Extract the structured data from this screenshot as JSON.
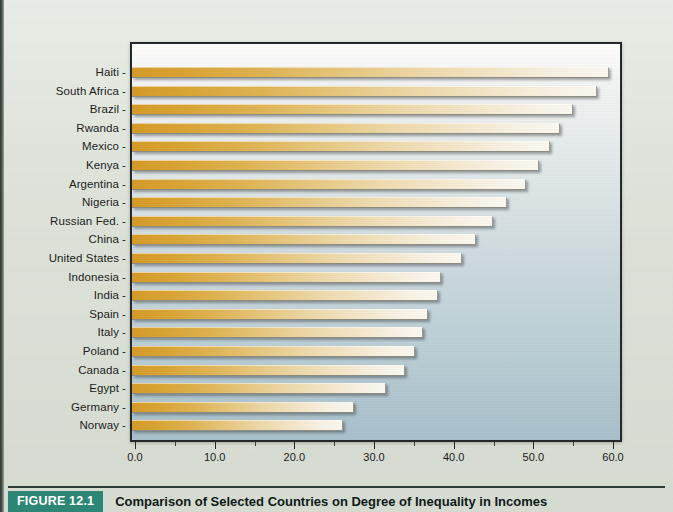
{
  "figure": {
    "tag": "FIGURE 12.1",
    "caption": "Comparison of Selected Countries on Degree of Inequality in Incomes"
  },
  "colors": {
    "page_background": "#dde3d9",
    "plot_top": "#fdfdfc",
    "plot_bottom": "#a8c0ca",
    "bar_start": "#d59a26",
    "bar_end": "#fbf8f1",
    "frame_border": "#23282a",
    "caption_tag_background": "#2d8673",
    "caption_tag_text": "#ffffff",
    "axis_text": "#1b1b1b"
  },
  "chart_data": {
    "type": "bar",
    "orientation": "horizontal",
    "title": "",
    "xlabel": "",
    "ylabel": "",
    "xlim": [
      0.0,
      60.0
    ],
    "xticks": [
      "0.0",
      "10.0",
      "20.0",
      "30.0",
      "40.0",
      "50.0",
      "60.0"
    ],
    "xtick_values": [
      0,
      10,
      20,
      30,
      40,
      50,
      60
    ],
    "minor_tick_interval": 5,
    "grid": false,
    "legend": false,
    "sorted": "descending",
    "categories": [
      "Haiti",
      "South Africa",
      "Brazil",
      "Rwanda",
      "Mexico",
      "Kenya",
      "Argentina",
      "Nigeria",
      "Russian Fed.",
      "China",
      "United States",
      "Indonesia",
      "India",
      "Spain",
      "Italy",
      "Poland",
      "Canada",
      "Egypt",
      "Germany",
      "Norway"
    ],
    "values": [
      59.2,
      57.8,
      54.7,
      53.1,
      51.9,
      50.5,
      48.8,
      46.5,
      44.7,
      42.6,
      40.8,
      38.1,
      37.8,
      36.5,
      35.9,
      34.9,
      33.6,
      31.3,
      27.2,
      25.8
    ]
  }
}
